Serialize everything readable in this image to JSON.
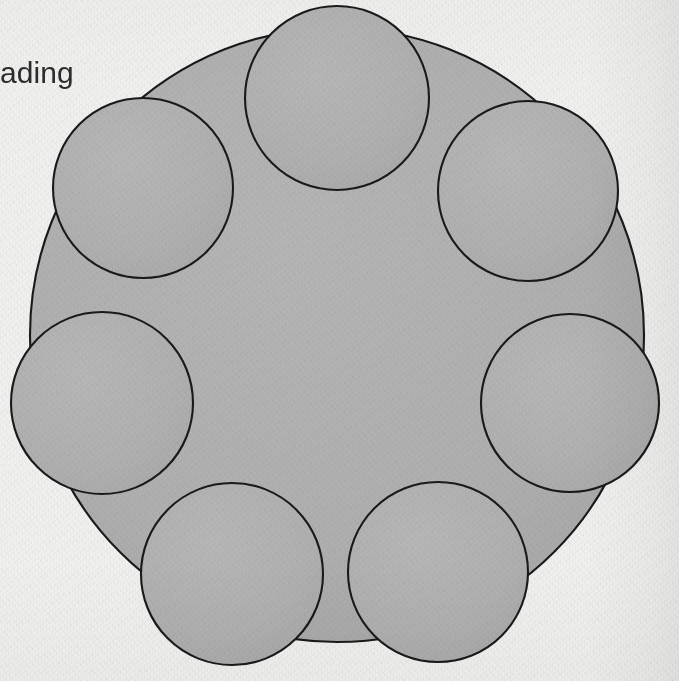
{
  "page": {
    "width": 679,
    "height": 681,
    "kind": "scanned-book-figure",
    "paper_color": "#f1f1f0",
    "ink_color": "#1a1a1a",
    "shape_fill_color": "#b0b0b0"
  },
  "caption": {
    "text": "ading",
    "note_clipped": "left-truncated at page edge",
    "x": 0,
    "y": 58,
    "color": "#2c2c2c",
    "font_size": 30
  },
  "chart_data": {
    "type": "diagram",
    "title": "",
    "subtitle": "",
    "xlabel": "",
    "ylabel": "",
    "grid": false,
    "legend_position": "none",
    "annotations": [
      "ading"
    ],
    "geometry": {
      "units": "pixels",
      "stroke_color": "#1a1a1a",
      "fill_color": "#b0b0b0",
      "stroke_width": 2.1,
      "satellite_count": 7,
      "satellite_radius": 90,
      "satellite_orbit_radius": 250,
      "parent": {
        "name": "outer-circle",
        "cx": 337,
        "cy": 335,
        "r": 307
      },
      "satellites": [
        {
          "name": "satellite-circle-top",
          "cx": 337,
          "cy": 98,
          "r": 92,
          "angle_deg": 270
        },
        {
          "name": "satellite-circle-upper-right",
          "cx": 528,
          "cy": 191,
          "r": 90,
          "angle_deg": 318
        },
        {
          "name": "satellite-circle-right",
          "cx": 570,
          "cy": 403,
          "r": 89,
          "angle_deg": 16
        },
        {
          "name": "satellite-circle-lower-right",
          "cx": 438,
          "cy": 572,
          "r": 90,
          "angle_deg": 64
        },
        {
          "name": "satellite-circle-lower-left",
          "cx": 232,
          "cy": 574,
          "r": 91,
          "angle_deg": 116
        },
        {
          "name": "satellite-circle-left",
          "cx": 102,
          "cy": 403,
          "r": 91,
          "angle_deg": 164
        },
        {
          "name": "satellite-circle-upper-left",
          "cx": 143,
          "cy": 188,
          "r": 90,
          "angle_deg": 222
        }
      ]
    }
  }
}
